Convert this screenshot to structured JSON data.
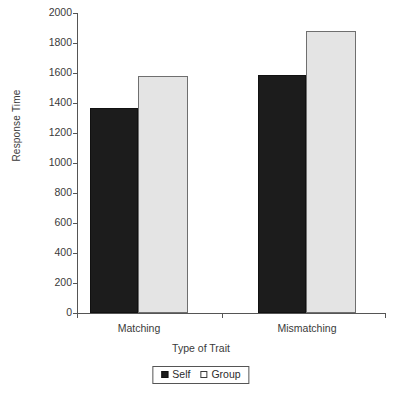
{
  "chart_data": {
    "type": "bar",
    "title": "",
    "xlabel": "Type of Trait",
    "ylabel": "Response Time",
    "categories": [
      "Matching",
      "Mismatching"
    ],
    "series": [
      {
        "name": "Self",
        "values": [
          1370,
          1590
        ],
        "color": "#1c1c1c"
      },
      {
        "name": "Group",
        "values": [
          1580,
          1880
        ],
        "color": "#e4e4e4"
      }
    ],
    "ylim": [
      0,
      2000
    ],
    "ytick_labels": [
      "2000",
      "1800",
      "1600",
      "1400",
      "1200",
      "1000",
      "800",
      "600",
      "400",
      "200",
      "0"
    ],
    "ytick_values": [
      2000,
      1800,
      1600,
      1400,
      1200,
      1000,
      800,
      600,
      400,
      200,
      0
    ],
    "grid": false,
    "legend_position": "bottom-center"
  },
  "legend": {
    "entries": [
      {
        "label": "Self",
        "swatch": "filled-square-black"
      },
      {
        "label": "Group",
        "swatch": "open-square-white"
      }
    ]
  }
}
